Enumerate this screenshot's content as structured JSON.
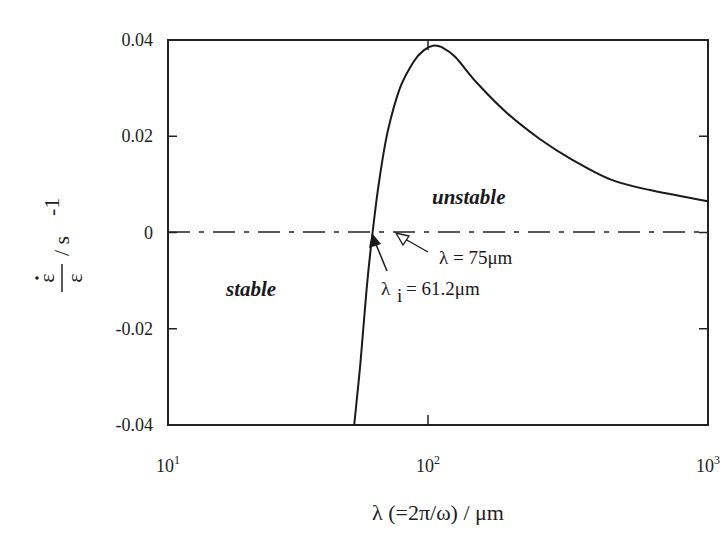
{
  "chart_data": {
    "type": "line",
    "title": "",
    "xlabel": "λ (=2π/ω) / μm",
    "ylabel": "ε̇/ε / s⁻¹",
    "xscale": "log",
    "xlim": [
      10,
      1000
    ],
    "ylim": [
      -0.04,
      0.04
    ],
    "grid": false,
    "legend": null,
    "x_ticks": [
      {
        "base": "10",
        "exp": "1"
      },
      {
        "base": "10",
        "exp": "2"
      },
      {
        "base": "10",
        "exp": "3"
      }
    ],
    "y_ticks": [
      "0.04",
      "0.02",
      "0",
      "-0.02",
      "-0.04"
    ],
    "series": [
      {
        "name": "growth rate",
        "x": [
          52,
          55,
          58,
          61.2,
          65,
          70,
          78,
          88,
          96,
          104,
          112,
          125,
          150,
          190,
          250,
          330,
          450,
          620,
          1000
        ],
        "y": [
          -0.04,
          -0.027,
          -0.012,
          0.0,
          0.011,
          0.021,
          0.03,
          0.0355,
          0.0378,
          0.0388,
          0.0385,
          0.0365,
          0.031,
          0.025,
          0.0195,
          0.015,
          0.011,
          0.0088,
          0.0065
        ]
      }
    ],
    "reference_lines": [
      {
        "type": "horizontal",
        "y": 0,
        "style": "dash-dot"
      }
    ],
    "annotations": [
      {
        "text": "unstable",
        "style": "bold-italic",
        "region": "above zero"
      },
      {
        "text": "stable",
        "style": "bold-italic",
        "region": "below zero"
      },
      {
        "text_prefix": "λ",
        "text_sub": "i",
        "text_suffix": "= 61.2μm",
        "points_to": {
          "x": 61.2,
          "y": 0
        },
        "arrow": "filled"
      },
      {
        "text": "λ = 75μm",
        "points_to": {
          "x": 75,
          "y": 0
        },
        "arrow": "open"
      }
    ]
  },
  "labels": {
    "x_axis_title": "λ (=2π/ω) / μm",
    "y_axis_num": "ε",
    "y_axis_den": "ε",
    "y_axis_unit": "/ s",
    "y_axis_unit_exp": "-1",
    "unstable": "unstable",
    "stable": "stable",
    "lambda_i_main": "λ",
    "lambda_i_sub": "i",
    "lambda_i_value": "= 61.2μm",
    "lambda_75": "λ = 75μm"
  }
}
